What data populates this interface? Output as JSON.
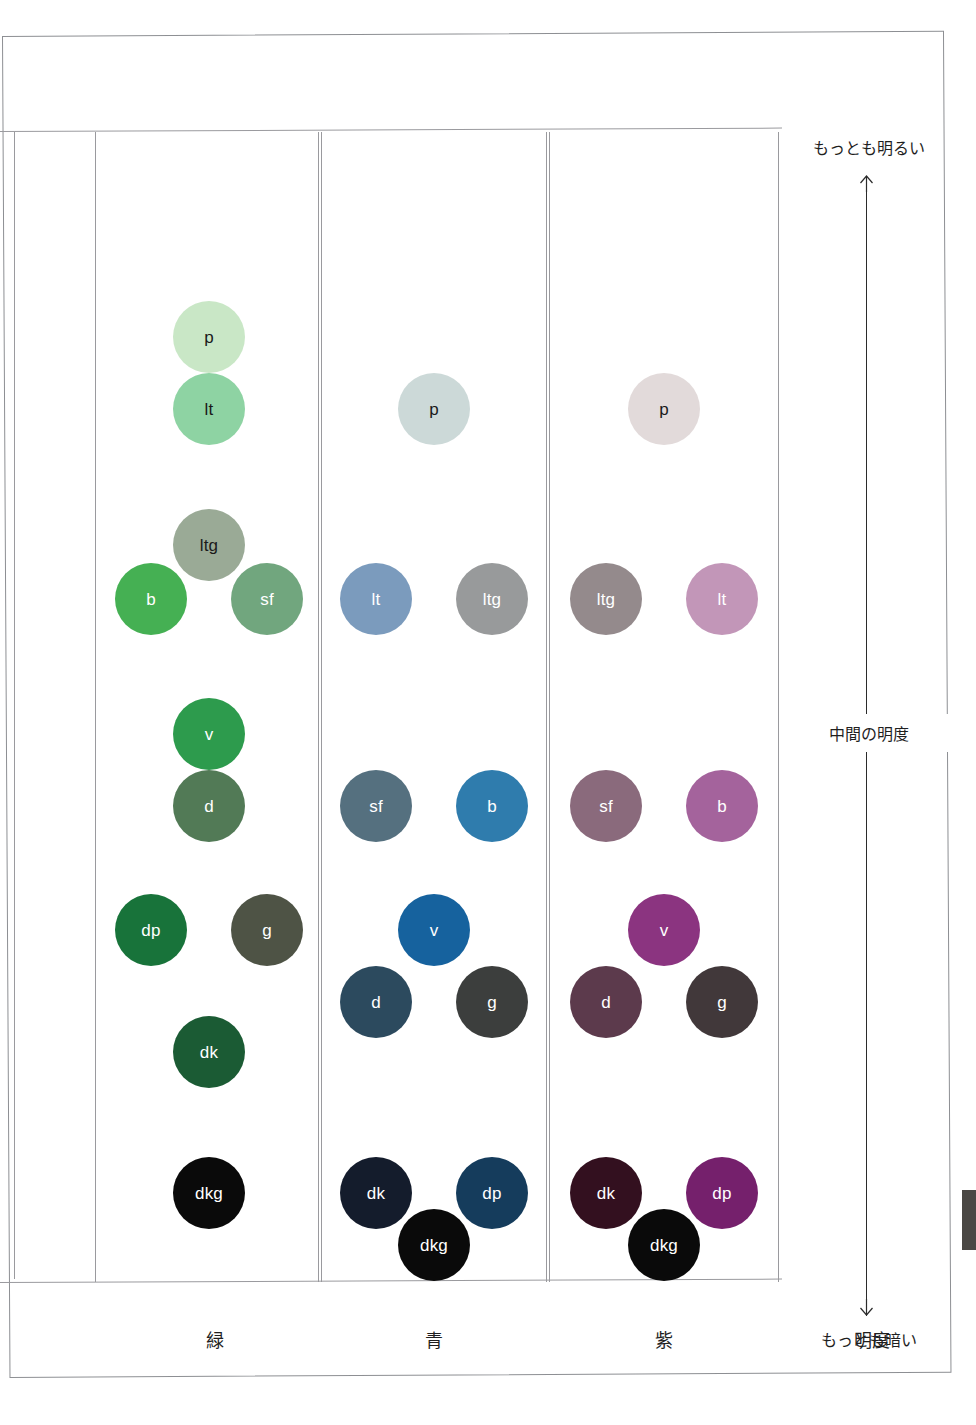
{
  "chart_data": {
    "type": "scatter",
    "title": "",
    "xlabel": "",
    "ylabel": "明度",
    "grid": true,
    "legend_position": "none",
    "axis": {
      "name": "明度",
      "top_label": "もっとも明るい",
      "middle_label": "中間の明度",
      "bottom_label": "もっとも暗い",
      "up_arrow": "arrow-up-icon",
      "down_arrow": "arrow-down-icon"
    },
    "columns": [
      {
        "key": "green",
        "label": "緑",
        "swatches": [
          {
            "code": "p",
            "x": 0,
            "y": 170,
            "size": 72,
            "color": "#c9e7c6",
            "text_color": "#1a1a1a"
          },
          {
            "code": "lt",
            "x": 0,
            "y": 242,
            "size": 72,
            "color": "#8ed3a3",
            "text_color": "#1a1a1a"
          },
          {
            "code": "ltg",
            "x": 0,
            "y": 378,
            "size": 72,
            "color": "#9aaa96",
            "text_color": "#1a1a1a"
          },
          {
            "code": "b",
            "x": -58,
            "y": 432,
            "size": 72,
            "color": "#45b053",
            "text_color": "#ffffff"
          },
          {
            "code": "sf",
            "x": 58,
            "y": 432,
            "size": 72,
            "color": "#71a67e",
            "text_color": "#ffffff"
          },
          {
            "code": "v",
            "x": 0,
            "y": 567,
            "size": 72,
            "color": "#2d9b4d",
            "text_color": "#ffffff"
          },
          {
            "code": "d",
            "x": 0,
            "y": 639,
            "size": 72,
            "color": "#527a56",
            "text_color": "#ffffff"
          },
          {
            "code": "dp",
            "x": -58,
            "y": 763,
            "size": 72,
            "color": "#18733a",
            "text_color": "#ffffff"
          },
          {
            "code": "g",
            "x": 58,
            "y": 763,
            "size": 72,
            "color": "#4e5345",
            "text_color": "#ffffff"
          },
          {
            "code": "dk",
            "x": 0,
            "y": 885,
            "size": 72,
            "color": "#1b5b34",
            "text_color": "#ffffff"
          },
          {
            "code": "dkg",
            "x": 0,
            "y": 1026,
            "size": 72,
            "color": "#0a0a0a",
            "text_color": "#ffffff"
          }
        ]
      },
      {
        "key": "blue",
        "label": "青",
        "swatches": [
          {
            "code": "p",
            "x": 0,
            "y": 242,
            "size": 72,
            "color": "#ccd9d8",
            "text_color": "#1a1a1a"
          },
          {
            "code": "lt",
            "x": -58,
            "y": 432,
            "size": 72,
            "color": "#7b9bbd",
            "text_color": "#ffffff"
          },
          {
            "code": "ltg",
            "x": 58,
            "y": 432,
            "size": 72,
            "color": "#989a9b",
            "text_color": "#ffffff"
          },
          {
            "code": "sf",
            "x": -58,
            "y": 639,
            "size": 72,
            "color": "#55707f",
            "text_color": "#ffffff"
          },
          {
            "code": "b",
            "x": 58,
            "y": 639,
            "size": 72,
            "color": "#2f7cad",
            "text_color": "#ffffff"
          },
          {
            "code": "v",
            "x": 0,
            "y": 763,
            "size": 72,
            "color": "#16629e",
            "text_color": "#ffffff"
          },
          {
            "code": "d",
            "x": -58,
            "y": 835,
            "size": 72,
            "color": "#2c4a5e",
            "text_color": "#ffffff"
          },
          {
            "code": "g",
            "x": 58,
            "y": 835,
            "size": 72,
            "color": "#3c3e3d",
            "text_color": "#ffffff"
          },
          {
            "code": "dk",
            "x": -58,
            "y": 1026,
            "size": 72,
            "color": "#141c2c",
            "text_color": "#ffffff"
          },
          {
            "code": "dp",
            "x": 58,
            "y": 1026,
            "size": 72,
            "color": "#153c5c",
            "text_color": "#ffffff"
          },
          {
            "code": "dkg",
            "x": 0,
            "y": 1078,
            "size": 72,
            "color": "#0a0a0a",
            "text_color": "#ffffff"
          }
        ]
      },
      {
        "key": "purple",
        "label": "紫",
        "swatches": [
          {
            "code": "p",
            "x": 0,
            "y": 242,
            "size": 72,
            "color": "#e2dada",
            "text_color": "#1a1a1a"
          },
          {
            "code": "ltg",
            "x": -58,
            "y": 432,
            "size": 72,
            "color": "#948a8c",
            "text_color": "#ffffff"
          },
          {
            "code": "lt",
            "x": 58,
            "y": 432,
            "size": 72,
            "color": "#c296b8",
            "text_color": "#ffffff"
          },
          {
            "code": "sf",
            "x": -58,
            "y": 639,
            "size": 72,
            "color": "#8a6a7c",
            "text_color": "#ffffff"
          },
          {
            "code": "b",
            "x": 58,
            "y": 639,
            "size": 72,
            "color": "#a4639c",
            "text_color": "#ffffff"
          },
          {
            "code": "v",
            "x": 0,
            "y": 763,
            "size": 72,
            "color": "#8b3480",
            "text_color": "#ffffff"
          },
          {
            "code": "d",
            "x": -58,
            "y": 835,
            "size": 72,
            "color": "#5c3a4c",
            "text_color": "#ffffff"
          },
          {
            "code": "g",
            "x": 58,
            "y": 835,
            "size": 72,
            "color": "#41383a",
            "text_color": "#ffffff"
          },
          {
            "code": "dk",
            "x": -58,
            "y": 1026,
            "size": 72,
            "color": "#33101f",
            "text_color": "#ffffff"
          },
          {
            "code": "dp",
            "x": 58,
            "y": 1026,
            "size": 72,
            "color": "#75206c",
            "text_color": "#ffffff"
          },
          {
            "code": "dkg",
            "x": 0,
            "y": 1078,
            "size": 72,
            "color": "#0a0a0a",
            "text_color": "#ffffff"
          }
        ]
      }
    ]
  }
}
